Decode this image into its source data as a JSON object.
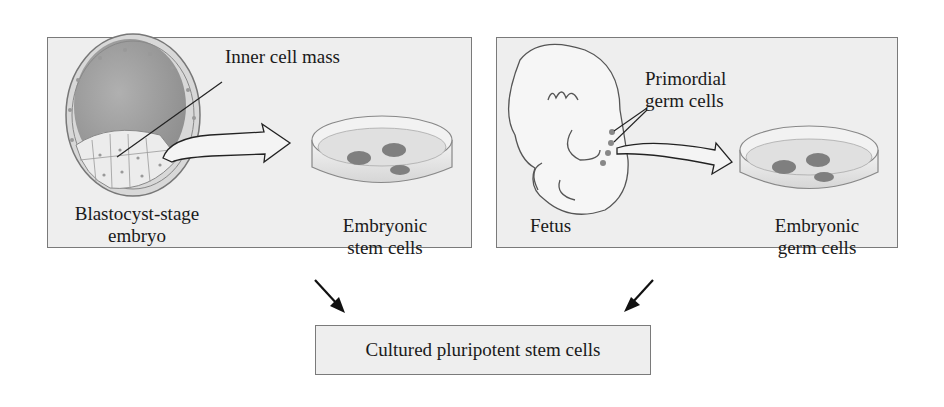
{
  "left_panel": {
    "title_hidden": "Embryonic stem cell derivation",
    "source_label": [
      "Blastocyst-stage",
      "embryo"
    ],
    "callout": "Inner cell mass",
    "product_label": [
      "Embryonic",
      "stem cells"
    ]
  },
  "right_panel": {
    "title_hidden": "Embryonic germ cell derivation",
    "source_label": "Fetus",
    "callout": [
      "Primordial",
      "germ cells"
    ],
    "product_label": [
      "Embryonic",
      "germ cells"
    ]
  },
  "result": {
    "label": "Cultured pluripotent stem cells"
  },
  "colors": {
    "panel_bg": "#eeeeee",
    "panel_border": "#7a7a7a",
    "cell_fill": "#8a8a8a",
    "cavity_fill": "#9a9a9a",
    "arrow": "#1a1a1a"
  }
}
